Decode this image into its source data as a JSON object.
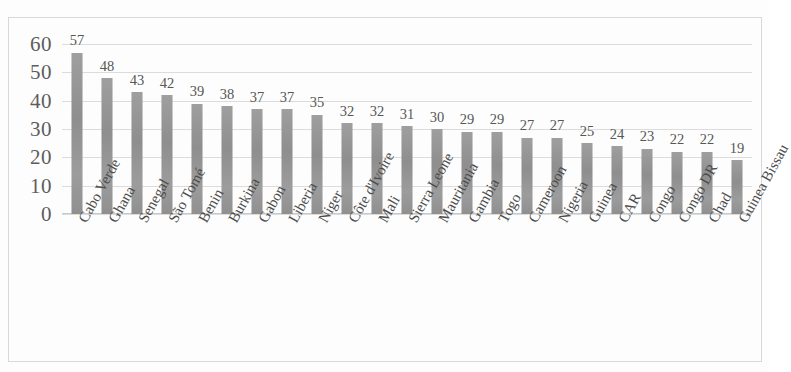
{
  "chart_data": {
    "type": "bar",
    "title": "",
    "subtitle": "",
    "xlabel": "",
    "ylabel": "",
    "ylim": [
      0,
      65
    ],
    "yticks": [
      0,
      10,
      20,
      30,
      40,
      50,
      60
    ],
    "ytick_labels": [
      "0",
      "10",
      "20",
      "30",
      "40",
      "50",
      "60"
    ],
    "grid": true,
    "grid_axis": "y",
    "legend": false,
    "legend_position": "none",
    "data_labels": true,
    "bar_color": "#949494",
    "gridline_color": "#dcdcdc",
    "categories": [
      "Cabo Verde",
      "Ghana",
      "Senegal",
      "São Tomé",
      "Benin",
      "Burkina",
      "Gabon",
      "Liberia",
      "Niger",
      "Côte d'Ivoire",
      "Mali",
      "Sierra Leone",
      "Mauritania",
      "Gambia",
      "Togo",
      "Cameroon",
      "Nigeria",
      "Guinea",
      "CAR",
      "Congo",
      "Congo DR",
      "Chad",
      "Guinea Bissau"
    ],
    "values": [
      57,
      48,
      43,
      42,
      39,
      38,
      37,
      37,
      35,
      32,
      32,
      31,
      30,
      29,
      29,
      27,
      27,
      25,
      24,
      23,
      22,
      22,
      19
    ],
    "value_labels": [
      "57",
      "48",
      "43",
      "42",
      "39",
      "38",
      "37",
      "37",
      "35",
      "32",
      "32",
      "31",
      "30",
      "29",
      "29",
      "27",
      "27",
      "25",
      "24",
      "23",
      "22",
      "22",
      "19"
    ]
  }
}
